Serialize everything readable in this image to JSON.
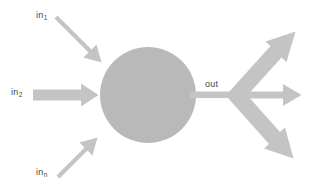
{
  "figure": {
    "background_color": "#ffffff",
    "node": {
      "name": "processing-node",
      "shape": "circle",
      "center_x": 148,
      "center_y": 95,
      "radius": 48,
      "fill_color": "#b9b9b9"
    },
    "arrow_color": "#c4c4c4",
    "text_color": "#444444"
  },
  "labels": {
    "in1": {
      "base": "in",
      "sub": "1"
    },
    "in2": {
      "base": "in",
      "sub": "2"
    },
    "inn": {
      "base": "in",
      "sub": "n"
    },
    "out": {
      "text": "out"
    }
  },
  "inputs": [
    {
      "name": "input-arrow-1",
      "label_key": "in1",
      "direction": "down-right",
      "from": [
        58,
        19
      ],
      "to": [
        99,
        60
      ]
    },
    {
      "name": "input-arrow-2",
      "label_key": "in2",
      "direction": "right",
      "from": [
        33,
        95
      ],
      "to": [
        97,
        95
      ]
    },
    {
      "name": "input-arrow-n",
      "label_key": "inn",
      "direction": "up-right",
      "from": [
        56,
        176
      ],
      "to": [
        99,
        133
      ]
    }
  ],
  "output": {
    "name": "output-fanout",
    "label_key": "out",
    "stem_from": [
      196,
      95
    ],
    "junction": [
      238,
      95
    ],
    "branches": [
      {
        "name": "output-arrow-up",
        "direction": "up-right",
        "to": [
          296,
          33
        ]
      },
      {
        "name": "output-arrow-right",
        "direction": "right",
        "to": [
          301,
          95
        ]
      },
      {
        "name": "output-arrow-down",
        "direction": "down-right",
        "to": [
          294,
          159
        ]
      }
    ]
  }
}
